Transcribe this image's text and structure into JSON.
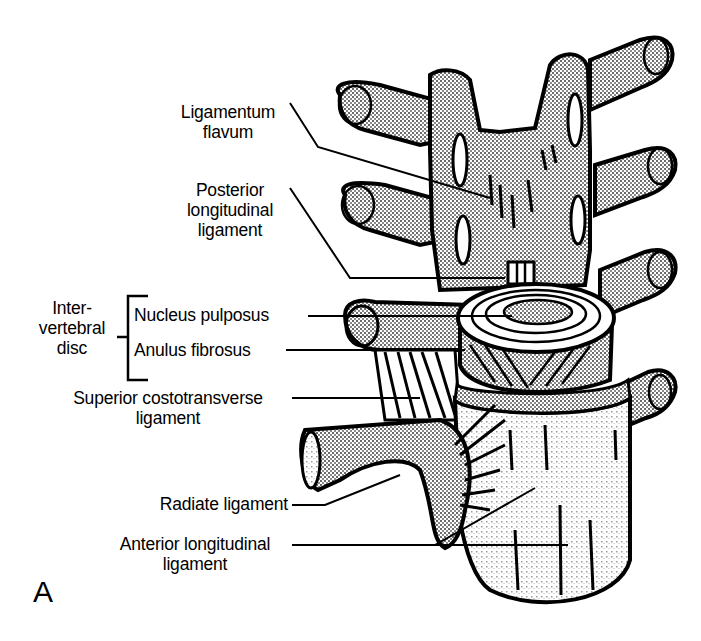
{
  "figure": {
    "panel_letter": "A",
    "colors": {
      "ink": "#000000",
      "background": "#ffffff",
      "stipple": "#9a9a9a",
      "light_stipple": "#d6d6d6"
    }
  },
  "labels": {
    "ligamentum_flavum": {
      "line1": "Ligamentum",
      "line2": "flavum"
    },
    "posterior_longitudinal_ligament": {
      "line1": "Posterior",
      "line2": "longitudinal",
      "line3": "ligament"
    },
    "intervertebral_disc": {
      "line1": "Inter-",
      "line2": "vertebral",
      "line3": "disc"
    },
    "nucleus_pulposus": "Nucleus pulposus",
    "anulus_fibrosus": "Anulus fibrosus",
    "superior_costotransverse_ligament": {
      "line1": "Superior costotransverse",
      "line2": "ligament"
    },
    "radiate_ligament": "Radiate ligament",
    "anterior_longitudinal_ligament": {
      "line1": "Anterior longitudinal",
      "line2": "ligament"
    }
  }
}
